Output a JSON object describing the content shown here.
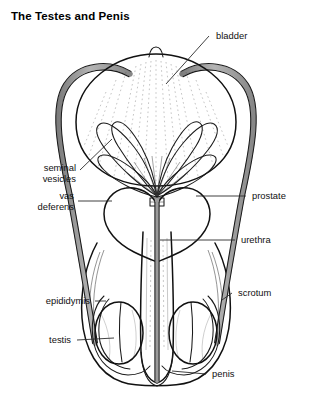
{
  "figure": {
    "title": "The Testes and Penis",
    "background_color": "#ffffff",
    "ink_color": "#111111",
    "organ_fill_light": "#fbfbfa",
    "organ_fill_gray": "#a9a9a9",
    "duct_fill_gray": "#9e9e9e",
    "width": 313,
    "height": 403
  },
  "labels": {
    "bladder": "bladder",
    "seminal_vesicles_line1": "seminal",
    "seminal_vesicles_line2": "vesicles",
    "vas_deferens_line1": "vas",
    "vas_deferens_line2": "deferens",
    "prostate": "prostate",
    "urethra": "urethra",
    "scrotum": "scrotum",
    "epididymis": "epididymis",
    "testis": "testis",
    "penis": "penis"
  },
  "structures": [
    {
      "name": "bladder",
      "label": "bladder",
      "side": "right",
      "fill": "#fbfbfa"
    },
    {
      "name": "seminal-vesicles",
      "label": "seminal vesicles",
      "side": "left",
      "fill": "#f6f6f4"
    },
    {
      "name": "vas-deferens",
      "label": "vas deferens",
      "side": "left",
      "fill": "#9e9e9e"
    },
    {
      "name": "prostate",
      "label": "prostate",
      "side": "right",
      "fill": "#f7f7f5"
    },
    {
      "name": "urethra",
      "label": "urethra",
      "side": "right",
      "fill": "#8f8f8f"
    },
    {
      "name": "scrotum",
      "label": "scrotum",
      "side": "right",
      "fill": "#ffffff"
    },
    {
      "name": "epididymis",
      "label": "epididymis",
      "side": "left",
      "fill": "#ffffff"
    },
    {
      "name": "testis",
      "label": "testis",
      "side": "left",
      "fill": "#a9a9a9"
    },
    {
      "name": "penis",
      "label": "penis",
      "side": "right",
      "fill": "#fbfbfa"
    }
  ]
}
